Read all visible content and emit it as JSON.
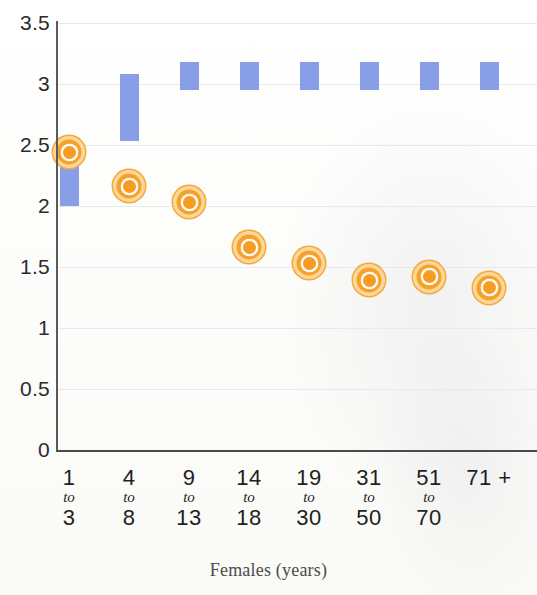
{
  "chart_data": {
    "type": "bar",
    "title": "",
    "subtitle": "",
    "xlabel": "Females (years)",
    "ylabel": "",
    "ylim": [
      0,
      3.5
    ],
    "ytick_labels": [
      "0",
      "0.5",
      "1",
      "1.5",
      "2",
      "2.5",
      "3",
      "3.5"
    ],
    "ytick_values": [
      0,
      0.5,
      1,
      1.5,
      2,
      2.5,
      3,
      3.5
    ],
    "grid": true,
    "legend": "none",
    "categories": [
      "1 to 3",
      "4 to 8",
      "9 to 13",
      "14 to 18",
      "19 to 30",
      "31 to 50",
      "51 to 70",
      "71 +"
    ],
    "category_lines": [
      {
        "first": "1",
        "to": "to",
        "second": "3"
      },
      {
        "first": "4",
        "to": "to",
        "second": "8"
      },
      {
        "first": "9",
        "to": "to",
        "second": "13"
      },
      {
        "first": "14",
        "to": "to",
        "second": "18"
      },
      {
        "first": "19",
        "to": "to",
        "second": "30"
      },
      {
        "first": "31",
        "to": "to",
        "second": "50"
      },
      {
        "first": "51",
        "to": "to",
        "second": "70"
      },
      {
        "first": "71 +",
        "to": "",
        "second": ""
      }
    ],
    "series": [
      {
        "name": "range-bar",
        "type": "floating-bar",
        "color": "#7E97E6",
        "low": [
          2.0,
          2.53,
          2.95,
          2.95,
          2.95,
          2.95,
          2.95,
          2.95
        ],
        "high": [
          2.5,
          3.08,
          3.18,
          3.18,
          3.18,
          3.18,
          3.18,
          3.18
        ]
      },
      {
        "name": "point-marker",
        "type": "scatter",
        "color": "#F79C22",
        "values": [
          2.44,
          2.16,
          2.03,
          1.66,
          1.53,
          1.39,
          1.42,
          1.33
        ]
      }
    ]
  }
}
